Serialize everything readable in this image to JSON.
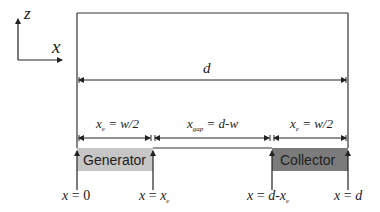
{
  "axes": {
    "vertical_label": "z",
    "horizontal_label": "x"
  },
  "dimensions": {
    "total": {
      "label": "d"
    },
    "generator_width": {
      "var": "x",
      "sub": "e",
      "rest": " = w/2"
    },
    "gap": {
      "var": "x",
      "sub": "gap",
      "rest": " = d-w"
    },
    "collector_width": {
      "var": "x",
      "sub": "e",
      "rest": " = w/2"
    }
  },
  "electrodes": {
    "generator": {
      "label": "Generator",
      "color": "#c6c6c6"
    },
    "collector": {
      "label": "Collector",
      "color": "#7b7b7b"
    }
  },
  "positions": [
    {
      "name": "x0",
      "lhs": "x",
      "rhs": "0",
      "sub": ""
    },
    {
      "name": "xe",
      "lhs": "x",
      "rhs": "x",
      "sub": "e"
    },
    {
      "name": "d-xe",
      "lhs": "x",
      "rhs": "d-x",
      "sub": "e"
    },
    {
      "name": "d",
      "lhs": "x",
      "rhs": "d",
      "sub": ""
    }
  ],
  "colors": {
    "line": "#333333",
    "generator_fill": "#c6c6c6",
    "collector_fill": "#7b7b7b"
  }
}
